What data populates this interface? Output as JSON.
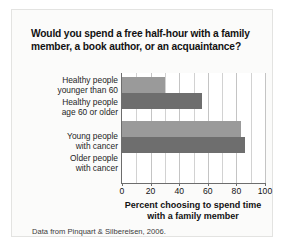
{
  "figure": {
    "title": "Would you spend a free half-hour with a family member, a book author, or an acquaintance?",
    "source_note": "Data from Pinquart & Silbereisen, 2006.",
    "colors": {
      "bar_light": "#9a9a9a",
      "bar_dark": "#6e6e6e",
      "axis": "#6d6d6d",
      "gridline": "#d2d2d2",
      "card_background": "#fbfbfa",
      "plot_background": "#ffffff"
    }
  },
  "chart_data": {
    "type": "bar",
    "orientation": "horizontal",
    "title": "Would you spend a free half-hour with a family member, a book author, or an acquaintance?",
    "xlabel": "Percent choosing to spend time with a family member",
    "ylabel": "",
    "xlim": [
      0,
      100
    ],
    "xticks": [
      0,
      20,
      40,
      60,
      80,
      100
    ],
    "xtick_labels": [
      "0",
      "20",
      "40",
      "60",
      "80",
      "100"
    ],
    "minor_gridlines": [
      10,
      30,
      50,
      70,
      90
    ],
    "grid": true,
    "legend": "none",
    "categories": [
      "Healthy people younger than 60",
      "Healthy people age 60 or older",
      "Young people with cancer",
      "Older people with cancer"
    ],
    "category_lines": [
      [
        "Healthy people",
        "younger than 60"
      ],
      [
        "Healthy people",
        "age 60 or older"
      ],
      [
        "Young people",
        "with cancer"
      ],
      [
        "Older people",
        "with cancer"
      ]
    ],
    "values": [
      30,
      56,
      83,
      86
    ],
    "bar_colors": [
      "#9a9a9a",
      "#6e6e6e",
      "#9a9a9a",
      "#6e6e6e"
    ],
    "groups": [
      {
        "name": "healthy",
        "categories": [
          0,
          1
        ]
      },
      {
        "name": "cancer",
        "categories": [
          2,
          3
        ]
      }
    ]
  }
}
